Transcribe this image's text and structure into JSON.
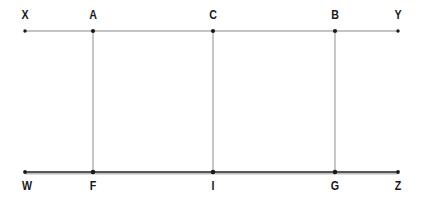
{
  "figure": {
    "type": "geometry-line-diagram",
    "background_color": "#ffffff",
    "ink_color": "#1a1a1a",
    "line_color": "#7a7a7a",
    "baseline_color": "#4a4a4a",
    "width": 424,
    "height": 204
  },
  "lines": {
    "top": {
      "name": "XY",
      "start_label": "X",
      "end_label": "Y",
      "y": 31,
      "x1": 25,
      "x2": 398
    },
    "bottom": {
      "name": "WZ",
      "start_label": "W",
      "end_label": "Z",
      "y": 172,
      "x1": 25,
      "x2": 398
    }
  },
  "transversals": [
    {
      "name": "AF",
      "top_label": "A",
      "bottom_label": "F",
      "x": 93
    },
    {
      "name": "CI",
      "top_label": "C",
      "bottom_label": "I",
      "x": 213
    },
    {
      "name": "BG",
      "top_label": "B",
      "bottom_label": "G",
      "x": 335
    }
  ],
  "labels": {
    "top": [
      {
        "text": "X",
        "x": 25
      },
      {
        "text": "A",
        "x": 93
      },
      {
        "text": "C",
        "x": 213
      },
      {
        "text": "B",
        "x": 335
      },
      {
        "text": "Y",
        "x": 398
      }
    ],
    "bottom": [
      {
        "text": "W",
        "x": 27
      },
      {
        "text": "F",
        "x": 93
      },
      {
        "text": "I",
        "x": 213
      },
      {
        "text": "G",
        "x": 335
      },
      {
        "text": "Z",
        "x": 398
      }
    ]
  }
}
